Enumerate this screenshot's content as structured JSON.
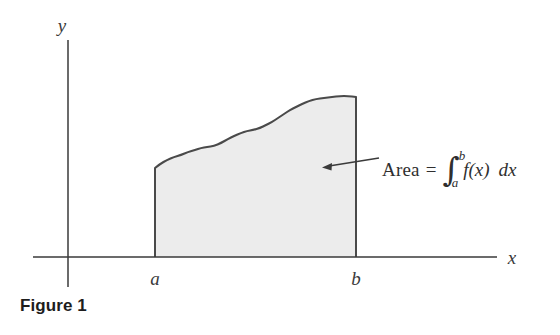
{
  "figure": {
    "caption": "Figure 1",
    "background_color": "#ffffff",
    "ink_color": "#3a3a3a",
    "region_fill_color": "#ececec",
    "region_stroke_color": "#4a4a4a"
  },
  "axes": {
    "y_label": "y",
    "x_label": "x",
    "x_axis_y_pixel": 257,
    "y_axis_x_pixel": 68,
    "x_axis_start_pixel": 33,
    "x_axis_end_pixel": 497,
    "y_axis_top_pixel": 40,
    "y_axis_bottom_pixel": 287
  },
  "ticks": [
    {
      "label": "a",
      "x_pixel": 155
    },
    {
      "label": "b",
      "x_pixel": 356
    }
  ],
  "annotation": {
    "word": "Area",
    "equals": "=",
    "integral_sign": "∫",
    "upper_limit": "b",
    "lower_limit": "a",
    "integrand": "f(x)",
    "differential": "dx",
    "full_text": "Area = ∫_a^b f(x) dx",
    "arrow_from_x": 379,
    "arrow_from_y": 158,
    "arrow_to_x": 322,
    "arrow_to_y": 167
  },
  "chart_data": {
    "type": "area",
    "title": "Figure 1",
    "xlabel": "x",
    "ylabel": "y",
    "grid": false,
    "legend": null,
    "x_tick_labels": [
      "a",
      "b"
    ],
    "x_tick_pixels": [
      155,
      356
    ],
    "baseline_y_pixel": 257,
    "curve_points": [
      [
        155,
        168
      ],
      [
        160,
        164
      ],
      [
        167,
        160
      ],
      [
        174,
        157
      ],
      [
        181,
        155
      ],
      [
        188,
        152
      ],
      [
        195,
        150
      ],
      [
        201,
        148
      ],
      [
        207,
        147
      ],
      [
        214,
        146
      ],
      [
        221,
        143
      ],
      [
        228,
        139
      ],
      [
        234,
        136
      ],
      [
        241,
        133
      ],
      [
        247,
        131
      ],
      [
        253,
        130
      ],
      [
        260,
        128
      ],
      [
        266,
        125
      ],
      [
        272,
        122
      ],
      [
        278,
        118
      ],
      [
        284,
        114
      ],
      [
        290,
        110
      ],
      [
        296,
        107
      ],
      [
        302,
        104
      ],
      [
        309,
        101
      ],
      [
        316,
        99
      ],
      [
        324,
        98
      ],
      [
        332,
        97
      ],
      [
        340,
        96
      ],
      [
        348,
        96
      ],
      [
        356,
        97
      ]
    ]
  }
}
